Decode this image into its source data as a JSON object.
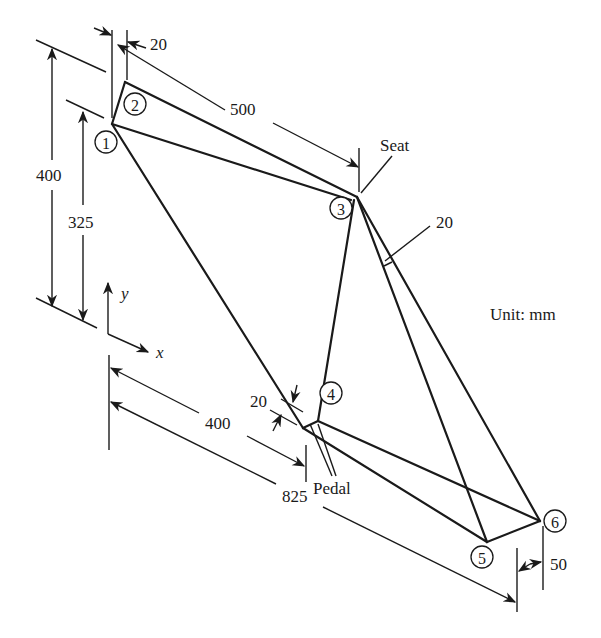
{
  "figure": {
    "unit_label": "Unit: mm",
    "seat_label": "Seat",
    "pedal_label": "Pedal",
    "axes": {
      "x": "x",
      "y": "y"
    }
  },
  "nodes": [
    {
      "id": "1",
      "label": "1"
    },
    {
      "id": "2",
      "label": "2"
    },
    {
      "id": "3",
      "label": "3"
    },
    {
      "id": "4",
      "label": "4"
    },
    {
      "id": "5",
      "label": "5"
    },
    {
      "id": "6",
      "label": "6"
    }
  ],
  "dimensions": {
    "top_offset": "20",
    "top_tube": "500",
    "height_total": "400",
    "height_node1": "325",
    "seat_tube_offset": "20",
    "pedal_offset": "20",
    "pedal_distance": "400",
    "rear_distance": "825",
    "rear_offset": "50"
  },
  "colors": {
    "ink": "#1a1a1a",
    "background": "#ffffff"
  }
}
